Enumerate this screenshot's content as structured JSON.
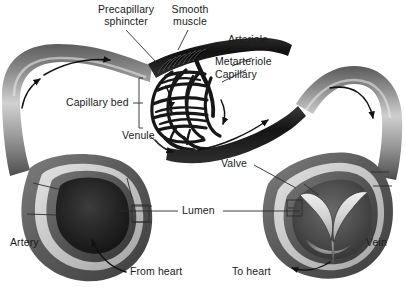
{
  "figure": {
    "background_color": "#ffffff",
    "text_color": "#1a1a1a"
  },
  "labels": {
    "precapillary_sphincter": "Precapillary\nsphincter",
    "smooth_muscle": "Smooth\nmuscle",
    "arteriole": "Arteriole",
    "metarteriole": "Metarteriole",
    "capillary": "Capillary",
    "capillary_bed": "Capillary bed",
    "venule": "Venule",
    "valve": "Valve",
    "lumen": "Lumen",
    "artery": "Artery",
    "vein": "Vein",
    "from_heart": "From heart",
    "to_heart": "To heart"
  },
  "colors": {
    "vessel_light": "#d4d4d4",
    "vessel_mid": "#9a9a9a",
    "vessel_dark": "#4a4a4a",
    "vessel_darkest": "#1c1c1c",
    "capillary_ink": "#181818",
    "wall_band": "#c9c9c9",
    "leader_line": "#2a2a2a"
  },
  "flow_arrows": [
    {
      "name": "artery-inflow-arrow",
      "location": "upper-left vessel",
      "direction": "rightward"
    },
    {
      "name": "arteriole-arrow",
      "location": "left vessel bend",
      "direction": "rightward"
    },
    {
      "name": "capillary-bed-arrow-upper",
      "location": "capillary bed top",
      "direction": "downward"
    },
    {
      "name": "capillary-bed-arrow-lower",
      "location": "capillary bed bottom",
      "direction": "rightward"
    },
    {
      "name": "capillary-bed-arrow-right",
      "location": "capillary bed right edge",
      "direction": "downward"
    },
    {
      "name": "venule-arrow",
      "location": "venule tube",
      "direction": "up-right"
    },
    {
      "name": "vein-outflow-arrow",
      "location": "upper-right vessel bend",
      "direction": "downward"
    },
    {
      "name": "from-heart-arrow",
      "location": "artery cross-section",
      "direction": "up-left"
    },
    {
      "name": "to-heart-arrow",
      "location": "vein cross-section",
      "direction": "down-left"
    }
  ]
}
